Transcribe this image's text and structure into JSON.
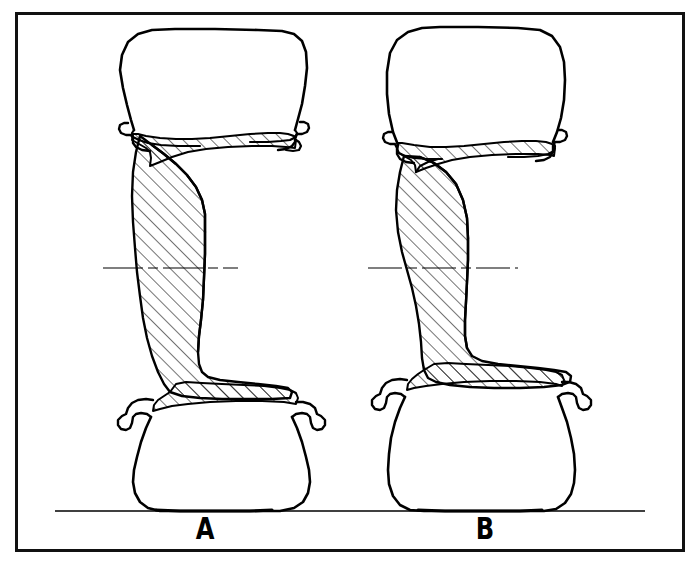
{
  "document": {
    "kind": "technical-line-drawing",
    "title": "Wheel rim cross-section comparison",
    "border_color": "#111111",
    "line_color": "#000000",
    "background_color": "#ffffff"
  },
  "figures": [
    {
      "id": "a",
      "label": "A",
      "description": "Wheel rim cross-section with wide flat-shouldered tire section and thick offset web",
      "center_x": 205,
      "tire_top_y": 30,
      "tire_bottom_y": 511
    },
    {
      "id": "b",
      "label": "B",
      "description": "Wheel rim cross-section with tall rounded tire section and slim straight web",
      "center_x": 485,
      "tire_top_y": 28,
      "tire_bottom_y": 511
    }
  ],
  "annotations": {
    "ground_line": {
      "name": "ground-line",
      "y": 511,
      "x_start": 55,
      "x_end": 645
    },
    "centerlines": [
      {
        "figure": "a",
        "y": 268,
        "x_start": 103,
        "x_end": 238
      },
      {
        "figure": "b",
        "y": 268,
        "x_start": 368,
        "x_end": 518
      }
    ]
  },
  "hatching": {
    "angle_degrees": 45,
    "spacing_px": 10,
    "stroke_width": 1.1
  }
}
